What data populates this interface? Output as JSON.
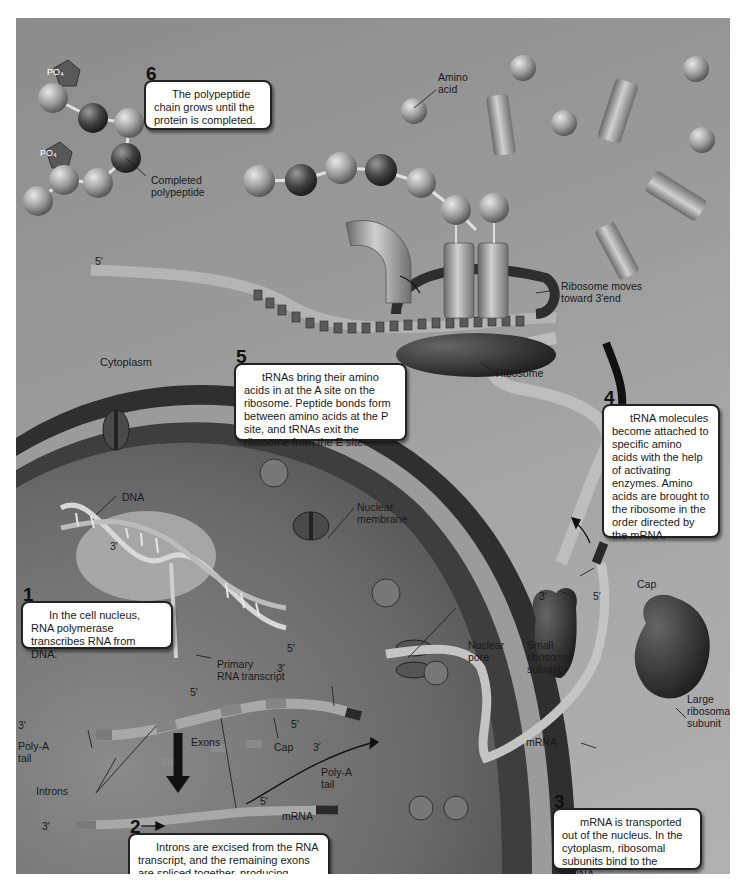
{
  "figure": {
    "type": "protein-synthesis-diagram",
    "regions": {
      "cytoplasm_label": "Cytoplasm"
    }
  },
  "steps": [
    {
      "number": "1",
      "text": "In the cell nucleus, RNA polymerase transcribes RNA from DNA."
    },
    {
      "number": "2",
      "text": "Introns are excised from the RNA transcript, and the remaining exons are spliced together, producing mRNA."
    },
    {
      "number": "3",
      "text": "mRNA is transported out of the nucleus. In the cytoplasm, ribosomal subunits bind to the mRNA."
    },
    {
      "number": "4",
      "text": "tRNA molecules become attached to specific amino acids with the help of activating enzymes. Amino acids are brought to the ribosome in the order directed by the mRNA."
    },
    {
      "number": "5",
      "text": "tRNAs bring their amino acids in at the A site on the ribosome. Peptide bonds form between amino acids at the P site, and tRNAs exit the ribosome from the E site."
    },
    {
      "number": "6",
      "text": "The polypeptide chain grows until the protein is completed."
    }
  ],
  "labels": {
    "po4_a": "PO₄",
    "po4_b": "PO₄",
    "completed_polypeptide": "Completed\npolypeptide",
    "amino_acid": "Amino\nacid",
    "ribosome_moves": "Ribosome moves\ntoward 3′end",
    "ribosome": "Ribosome",
    "five_prime_top": "5′",
    "dna": "DNA",
    "nuclear_membrane": "Nuclear\nmembrane",
    "rna_polymerase": "RNA\npolymerase",
    "three_prime_dna": "3′",
    "five_prime_dna_right": "5′",
    "three_prime_dna_right": "3′",
    "primary_rna_transcript": "Primary\nRNA transcript",
    "five_prime_transcript": "5′",
    "three_prime_transcript": "3′",
    "poly_a_tail_left": "Poly-A\ntail",
    "exons": "Exons",
    "cap_left": "Cap",
    "five_prime_cap_left": "5′",
    "introns": "Introns",
    "three_prime_mrna": "3′",
    "five_prime_mrna": "5′",
    "mrna_left": "mRNA",
    "three_prime_pore": "3′",
    "poly_a_tail_pore": "Poly-A\ntail",
    "nuclear_pore": "Nuclear\npore",
    "three_prime_cyto": "3′",
    "five_prime_cyto": "5′",
    "cap_right": "Cap",
    "small_subunit": "Small\nribosomal\nsubunit",
    "large_subunit": "Large\nribosomal\nsubunit",
    "mrna_right": "mRNA"
  },
  "colors": {
    "background": "#9a9a9a",
    "nucleus_dark": "#3a3a3a",
    "nucleus_light": "#7d7d7d",
    "membrane_band": "#a8a8a8",
    "mrna_strip": "#b8b8b8",
    "ribosome": "#2e2e2e",
    "callout_bg": "#ffffff"
  }
}
